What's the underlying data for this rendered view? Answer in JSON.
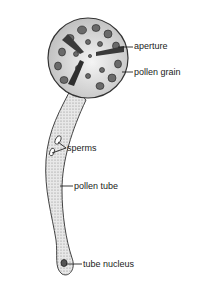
{
  "diagram": {
    "labels": [
      {
        "id": "aperture",
        "text": "aperture"
      },
      {
        "id": "pollen-grain",
        "text": "pollen grain"
      },
      {
        "id": "sperms",
        "text": "sperms"
      },
      {
        "id": "pollen-tube",
        "text": "pollen tube"
      },
      {
        "id": "tube-nucleus",
        "text": "tube nucleus"
      }
    ]
  }
}
